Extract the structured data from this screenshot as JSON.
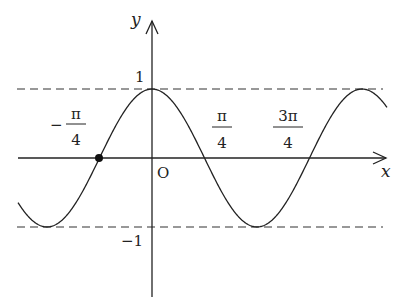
{
  "chart_data": {
    "type": "line",
    "title": "",
    "function": "y = cos(2x)",
    "xlabel": "x",
    "ylabel": "y",
    "origin_label": "O",
    "x_tick_labels": [
      {
        "num": "π",
        "den": "4",
        "sign": "−",
        "value": -0.7854
      },
      {
        "num": "π",
        "den": "4",
        "sign": "",
        "value": 0.7854
      },
      {
        "num": "3π",
        "den": "4",
        "sign": "",
        "value": 2.3562
      }
    ],
    "y_tick_labels": [
      {
        "label": "1",
        "value": 1
      },
      {
        "label": "−1",
        "value": -1
      }
    ],
    "dashed_lines": [
      {
        "y": 1
      },
      {
        "y": -1
      }
    ],
    "highlighted_point": {
      "x": -0.7854,
      "y": 0
    },
    "x_range": [
      -2.06,
      3.5
    ],
    "y_range": [
      -1,
      1
    ],
    "grid": false,
    "series": [
      {
        "name": "curve",
        "period": 3.1416,
        "amplitude": 1,
        "peak_at_x": 0
      }
    ]
  },
  "labels": {
    "x_axis": "x",
    "y_axis": "y",
    "origin": "O",
    "y_one": "1",
    "y_neg_one": "−1",
    "neg_pi_4_sign": "−",
    "neg_pi_4_num": "π",
    "neg_pi_4_den": "4",
    "pi_4_num": "π",
    "pi_4_den": "4",
    "three_pi_4_num": "3π",
    "three_pi_4_den": "4"
  }
}
